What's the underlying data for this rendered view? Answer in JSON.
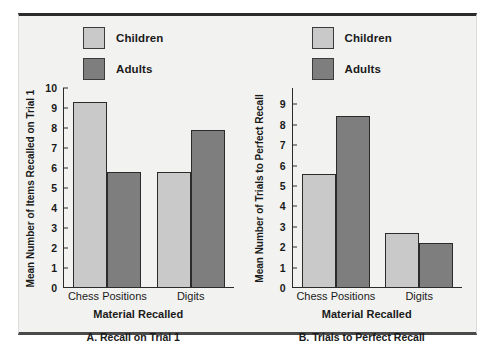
{
  "figure": {
    "background_color": "#f2f2f0",
    "frame_color": "#2b2b2b"
  },
  "legend": {
    "children_label": "Children",
    "adults_label": "Adults",
    "children_color": "#c9c9c9",
    "adults_color": "#7e7e7e"
  },
  "chart_data": [
    {
      "type": "bar",
      "title": "A. Recall on Trial 1",
      "xlabel": "Material Recalled",
      "ylabel": "Mean Number of Items Recalled on Trial 1",
      "categories": [
        "Chess Positions",
        "Digits"
      ],
      "series": [
        {
          "name": "Children",
          "color": "#c9c9c9",
          "values": [
            9.3,
            5.8
          ]
        },
        {
          "name": "Adults",
          "color": "#7e7e7e",
          "values": [
            5.8,
            7.9
          ]
        }
      ],
      "ylim": [
        0,
        10
      ],
      "yticks": [
        0,
        1,
        2,
        3,
        4,
        5,
        6,
        7,
        8,
        9,
        10
      ],
      "ytick_labels": [
        "0",
        "1",
        "2",
        "3",
        "4",
        "5",
        "6",
        "7",
        "8",
        "9",
        "10"
      ],
      "grid": false,
      "legend_position": "top-left"
    },
    {
      "type": "bar",
      "title": "B. Trials to Perfect Recall",
      "xlabel": "Material Recalled",
      "ylabel": "Mean Number of Trials to Perfect Recall",
      "categories": [
        "Chess Positions",
        "Digits"
      ],
      "series": [
        {
          "name": "Children",
          "color": "#c9c9c9",
          "values": [
            5.6,
            2.7
          ]
        },
        {
          "name": "Adults",
          "color": "#7e7e7e",
          "values": [
            8.45,
            2.2
          ]
        }
      ],
      "ylim": [
        0,
        9.8
      ],
      "yticks": [
        0,
        1,
        2,
        3,
        4,
        5,
        6,
        7,
        8,
        9
      ],
      "ytick_labels": [
        "0",
        "1",
        "2",
        "3",
        "4",
        "5",
        "6",
        "7",
        "8",
        "9"
      ],
      "grid": false,
      "legend_position": "top-left"
    }
  ]
}
